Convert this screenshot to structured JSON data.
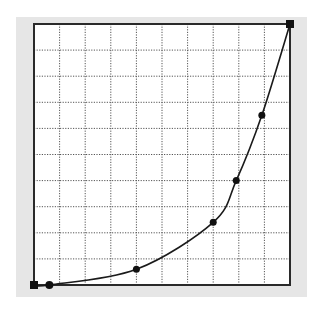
{
  "editor": {
    "name": "tone-curve-editor",
    "grid_divisions": 10,
    "colors": {
      "panel": "#e6e6e6",
      "plot_bg": "#ffffff",
      "frame": "#2a2a2a",
      "grid": "#555555",
      "curve": "#1a1a1a",
      "point": "#111111"
    }
  },
  "chart_data": {
    "type": "line",
    "title": "",
    "xlabel": "",
    "ylabel": "",
    "xlim": [
      0,
      1
    ],
    "ylim": [
      0,
      1
    ],
    "grid": true,
    "grid_divisions": 10,
    "control_points": [
      {
        "x": 0.0,
        "y": 0.0,
        "kind": "endpoint"
      },
      {
        "x": 0.06,
        "y": 0.0,
        "kind": "point"
      },
      {
        "x": 0.4,
        "y": 0.06,
        "kind": "point"
      },
      {
        "x": 0.7,
        "y": 0.24,
        "kind": "point"
      },
      {
        "x": 0.79,
        "y": 0.4,
        "kind": "point"
      },
      {
        "x": 0.89,
        "y": 0.65,
        "kind": "point"
      },
      {
        "x": 1.0,
        "y": 1.0,
        "kind": "endpoint"
      }
    ],
    "series": [
      {
        "name": "curve",
        "x": [
          0.0,
          0.06,
          0.2,
          0.3,
          0.4,
          0.5,
          0.6,
          0.7,
          0.79,
          0.89,
          1.0
        ],
        "y": [
          0.0,
          0.0,
          0.02,
          0.04,
          0.06,
          0.1,
          0.16,
          0.24,
          0.4,
          0.65,
          1.0
        ]
      }
    ]
  }
}
